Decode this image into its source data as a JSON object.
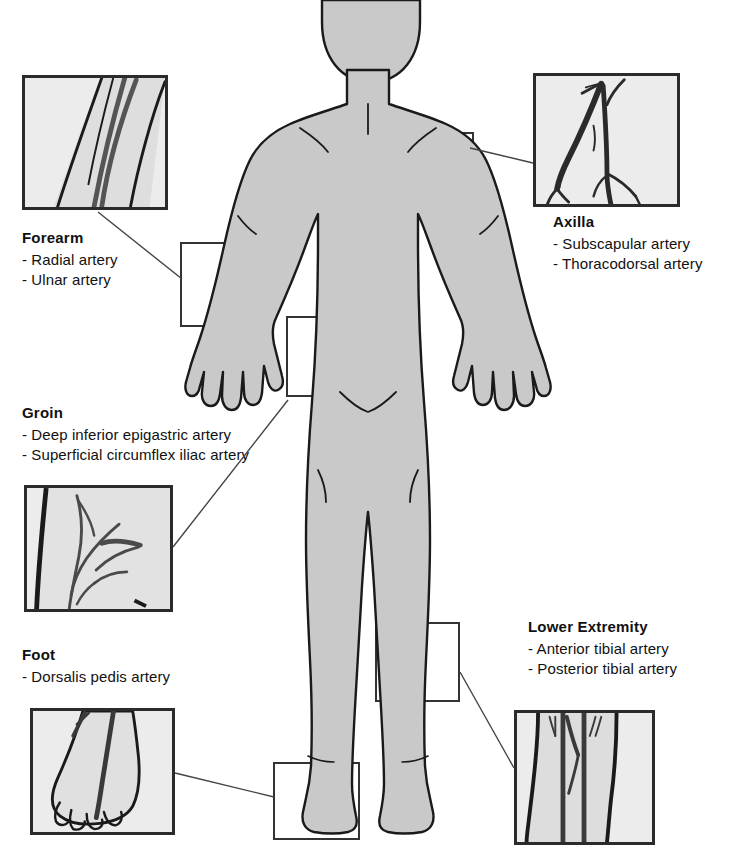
{
  "diagram": {
    "body_figure": {
      "name": "anterior-human-body-outline",
      "fill_color": "#c9c9c9",
      "outline_color": "#1a1a1a"
    },
    "colors": {
      "inset_border": "#2b2b2b",
      "inset_background": "#ececec",
      "marker_border": "#333333",
      "leader_line": "#444444",
      "text": "#111111",
      "skin_fill": "#c9c9c9",
      "artery": "#555555"
    }
  },
  "sites": [
    {
      "id": "forearm",
      "title": "Forearm",
      "arteries": [
        "- Radial artery",
        "- Ulnar artery"
      ],
      "inset": {
        "x": 22,
        "y": 75,
        "w": 146,
        "h": 135
      },
      "label": {
        "x": 22,
        "y": 228
      },
      "marker": {
        "x": 180,
        "y": 242,
        "w": 88,
        "h": 85
      },
      "leader": {
        "x1": 98,
        "y1": 212,
        "x2": 182,
        "y2": 279
      }
    },
    {
      "id": "axilla",
      "title": "Axilla",
      "arteries": [
        "- Subscapular artery",
        "- Thoracodorsal artery"
      ],
      "inset": {
        "x": 533,
        "y": 73,
        "w": 147,
        "h": 134
      },
      "label": {
        "x": 553,
        "y": 212
      },
      "marker": {
        "x": 388,
        "y": 132,
        "w": 86,
        "h": 78
      },
      "leader": {
        "x1": 533,
        "y1": 163,
        "x2": 470,
        "y2": 148
      }
    },
    {
      "id": "groin",
      "title": "Groin",
      "arteries": [
        "- Deep inferior epigastric artery",
        "- Superficial circumflex iliac artery"
      ],
      "inset": {
        "x": 24,
        "y": 485,
        "w": 149,
        "h": 127
      },
      "label": {
        "x": 22,
        "y": 403
      },
      "marker": {
        "x": 286,
        "y": 316,
        "w": 86,
        "h": 81
      },
      "leader": {
        "x1": 173,
        "y1": 547,
        "x2": 288,
        "y2": 400
      }
    },
    {
      "id": "foot",
      "title": "Foot",
      "arteries": [
        "- Dorsalis pedis artery"
      ],
      "inset": {
        "x": 30,
        "y": 708,
        "w": 145,
        "h": 127
      },
      "label": {
        "x": 22,
        "y": 645
      },
      "marker": {
        "x": 273,
        "y": 762,
        "w": 87,
        "h": 78
      },
      "leader": {
        "x1": 175,
        "y1": 773,
        "x2": 274,
        "y2": 797
      }
    },
    {
      "id": "lower-extremity",
      "title": "Lower Extremity",
      "arteries": [
        "- Anterior tibial artery",
        "- Posterior tibial artery"
      ],
      "inset": {
        "x": 514,
        "y": 710,
        "w": 141,
        "h": 135
      },
      "label": {
        "x": 528,
        "y": 617
      },
      "marker": {
        "x": 375,
        "y": 622,
        "w": 85,
        "h": 80
      },
      "leader": {
        "x1": 514,
        "y1": 768,
        "x2": 460,
        "y2": 672
      }
    }
  ]
}
